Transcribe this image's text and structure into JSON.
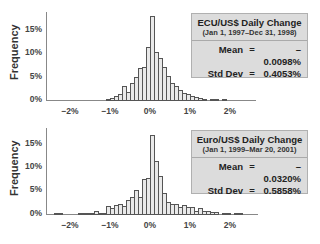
{
  "chart_data": [
    {
      "type": "bar",
      "title": "ECU/US$ Daily Change",
      "subtitle": "(Jan 1, 1997–Dec 31, 1998)",
      "xlabel": "",
      "ylabel": "Frequency",
      "xlim": [
        -2.5,
        2.7
      ],
      "ylim": [
        0,
        18
      ],
      "x_ticks": [
        "-2%",
        "-1%",
        "0%",
        "1%",
        "2%"
      ],
      "y_ticks": [
        "0%",
        "5%",
        "10%",
        "15%"
      ],
      "grid": false,
      "bin_width": 0.1,
      "bin_starts": [
        -1.1,
        -1.0,
        -0.9,
        -0.8,
        -0.7,
        -0.6,
        -0.5,
        -0.4,
        -0.3,
        -0.2,
        -0.1,
        0.0,
        0.1,
        0.2,
        0.3,
        0.4,
        0.5,
        0.6,
        0.7,
        0.8,
        0.9,
        1.0,
        1.1,
        1.2,
        1.3,
        1.5,
        1.6,
        1.8
      ],
      "values": [
        0.3,
        0.5,
        0.9,
        1.3,
        2.9,
        1.8,
        3.6,
        4.9,
        6.9,
        7.1,
        11.3,
        18.0,
        10.3,
        9.0,
        7.1,
        5.2,
        3.6,
        2.9,
        2.2,
        1.6,
        1.2,
        0.9,
        0.7,
        0.5,
        0.3,
        0.3,
        0.3,
        0.3
      ],
      "stats": {
        "mean": "– 0.0098%",
        "stddev": "0.4053%"
      }
    },
    {
      "type": "bar",
      "title": "Euro/US$ Daily Change",
      "subtitle": "(Jan 1, 1999–Mar 20, 2001)",
      "xlabel": "",
      "ylabel": "Frequency",
      "xlim": [
        -2.5,
        2.7
      ],
      "ylim": [
        0,
        17
      ],
      "x_ticks": [
        "-2%",
        "-1%",
        "0%",
        "1%",
        "2%"
      ],
      "y_ticks": [
        "0%",
        "5%",
        "10%",
        "15%"
      ],
      "grid": false,
      "bin_width": 0.1,
      "bin_starts": [
        -2.4,
        -2.3,
        -1.8,
        -1.7,
        -1.6,
        -1.5,
        -1.4,
        -1.3,
        -1.2,
        -1.1,
        -1.0,
        -0.9,
        -0.8,
        -0.7,
        -0.6,
        -0.5,
        -0.4,
        -0.3,
        -0.2,
        -0.1,
        0.0,
        0.1,
        0.2,
        0.3,
        0.4,
        0.5,
        0.6,
        0.7,
        0.8,
        0.9,
        1.0,
        1.1,
        1.2,
        1.3,
        1.4,
        1.5,
        1.6,
        1.8,
        1.9,
        2.1,
        2.2
      ],
      "values": [
        0.2,
        0.2,
        0.2,
        0.2,
        0.2,
        0.2,
        0.6,
        0.3,
        0.2,
        1.8,
        1.3,
        2.0,
        2.2,
        1.8,
        3.1,
        3.7,
        5.2,
        3.7,
        7.4,
        7.8,
        17.0,
        11.3,
        8.2,
        4.6,
        2.6,
        2.2,
        2.2,
        1.6,
        2.0,
        1.6,
        1.5,
        0.6,
        1.3,
        0.7,
        0.7,
        0.4,
        0.4,
        0.2,
        0.2,
        0.2,
        0.2
      ],
      "stats": {
        "mean": "– 0.0320%",
        "stddev": "0.5858%"
      }
    }
  ],
  "panels": {
    "top": {
      "ylabel": "Frequency",
      "yticks": [
        "15%",
        "10%",
        "5%",
        "0%"
      ],
      "xticks": [
        "−2%",
        "−1%",
        "0%",
        "1%",
        "2%"
      ],
      "legend": {
        "title": "ECU/US$ Daily Change",
        "subtitle": "(Jan 1, 1997–Dec 31, 1998)",
        "mean_label": "Mean",
        "mean_value": "– 0.0098%",
        "std_label": "Std Dev",
        "std_value": "0.4053%",
        "equals": "="
      }
    },
    "bottom": {
      "ylabel": "Frequency",
      "yticks": [
        "15%",
        "10%",
        "5%",
        "0%"
      ],
      "xticks": [
        "−2%",
        "−1%",
        "0%",
        "1%",
        "2%"
      ],
      "legend": {
        "title": "Euro/US$ Daily Change",
        "subtitle": "(Jan 1, 1999–Mar 20, 2001)",
        "mean_label": "Mean",
        "mean_value": "– 0.0320%",
        "std_label": "Std Dev",
        "std_value": "0.5858%",
        "equals": "="
      }
    }
  }
}
